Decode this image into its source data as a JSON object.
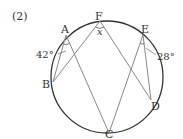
{
  "problem_number": "(2)",
  "circle": {
    "cx": 107,
    "cy": 77,
    "r": 56,
    "stroke": "#333333"
  },
  "points": {
    "A": {
      "label": "A",
      "x": 66,
      "y": 35
    },
    "F": {
      "label": "F",
      "x": 100,
      "y": 21
    },
    "E": {
      "label": "E",
      "x": 143,
      "y": 35
    },
    "B": {
      "label": "B",
      "x": 53,
      "y": 82
    },
    "C": {
      "label": "C",
      "x": 109,
      "y": 133
    },
    "D": {
      "label": "D",
      "x": 151,
      "y": 100
    }
  },
  "segments": [
    {
      "from": "A",
      "to": "B"
    },
    {
      "from": "A",
      "to": "C"
    },
    {
      "from": "F",
      "to": "B"
    },
    {
      "from": "F",
      "to": "D"
    },
    {
      "from": "E",
      "to": "C"
    },
    {
      "from": "E",
      "to": "D"
    }
  ],
  "angles": {
    "A": {
      "label": "42°",
      "at": "A",
      "between": [
        "B",
        "C"
      ]
    },
    "E": {
      "label": "28°",
      "at": "E",
      "between": [
        "C",
        "D"
      ]
    },
    "F": {
      "label": "x",
      "at": "F",
      "between": [
        "B",
        "D"
      ]
    }
  },
  "line_color": "#888888"
}
